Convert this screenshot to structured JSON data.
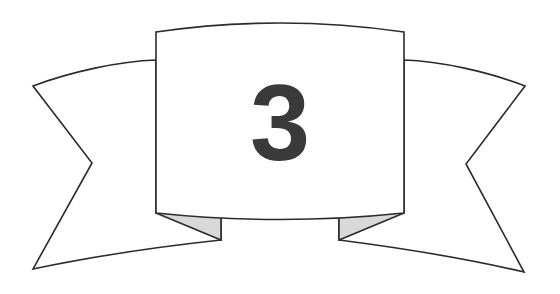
{
  "graphic": {
    "kind": "award-banner-ribbon",
    "title": "Numbered banner ribbon",
    "number_label": "3",
    "canvas": {
      "width": 560,
      "height": 294
    },
    "colors": {
      "background": "#ffffff",
      "panel_fill": "#ffffff",
      "arm_fill": "#ffffff",
      "fold_fill": "#d9d9d9",
      "outline": "#2b2b2b",
      "number_color": "#3a3a3a"
    },
    "stroke_width": 1.6,
    "number": {
      "text": "3",
      "center_x": 280,
      "baseline_y": 160,
      "font_size": 108
    },
    "panel": {
      "left_x": 156,
      "right_x": 404,
      "top_y": 32,
      "top_arc_peak_y": 21,
      "bottom_y": 213,
      "bottom_arc_dip_y": 220
    },
    "left_arm": {
      "outer_tip_top": [
        33,
        86
      ],
      "notch_apex": [
        92,
        163
      ],
      "outer_tip_bottom": [
        33,
        269
      ],
      "join_top": [
        156,
        60
      ],
      "join_bottom": [
        221,
        240
      ]
    },
    "right_arm": {
      "outer_tip_top": [
        525,
        86
      ],
      "notch_apex": [
        466,
        164
      ],
      "outer_tip_bottom": [
        524,
        272
      ],
      "join_top": [
        404,
        60
      ],
      "join_bottom": [
        339,
        240
      ]
    },
    "left_fold": {
      "points": "156,213 221,213 221,240"
    },
    "right_fold": {
      "points": "404,213 339,213 339,240"
    }
  }
}
